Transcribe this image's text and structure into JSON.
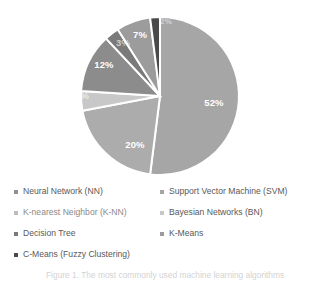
{
  "figure": {
    "background_color": "#ffffff",
    "caption_partial": "Figure 1. The most commonly used machine learning algorithms"
  },
  "chart_data": {
    "type": "pie",
    "title": "",
    "subtitle": "",
    "xlabel": "",
    "ylabel": "",
    "grid": false,
    "legend_position": "bottom",
    "legend_columns": 2,
    "start_angle_deg": 0,
    "direction": "clockwise",
    "categories": [
      "Support Vector Machine (SVM)",
      "Neural Network (NN)",
      "Bayesian Networks (BN)",
      "K-nearest Neighbor (K-NN)",
      "Decision Tree",
      "K-Means",
      "C-Means (Fuzzy Clustering)"
    ],
    "values": [
      52,
      20,
      4,
      12,
      3,
      7,
      2
    ],
    "labels": [
      "52%",
      "20%",
      "4%",
      "12%",
      "3%",
      "7%",
      "2%"
    ],
    "colors": [
      "#a6a6a6",
      "#acacac",
      "#c8c8c8",
      "#8c8c8c",
      "#7a7a7a",
      "#9c9c9c",
      "#4a4a4a"
    ],
    "slice_border_color": "#ffffff",
    "slice_border_width": 2,
    "units": "percent"
  },
  "pie": {
    "center_x": 160,
    "center_y": 96,
    "radius": 79,
    "slices": [
      {
        "name": "svm",
        "label": "52%",
        "value": 52,
        "color": "#a6a6a6",
        "label_x": 214,
        "label_y": 103,
        "label_style": "normal"
      },
      {
        "name": "nn",
        "label": "20%",
        "value": 20,
        "color": "#acacac",
        "label_x": 135,
        "label_y": 145,
        "label_style": "normal"
      },
      {
        "name": "bn",
        "label": "4%",
        "value": 4,
        "color": "#c8c8c8",
        "label_x": 82,
        "label_y": 96,
        "label_style": "faint"
      },
      {
        "name": "knn",
        "label": "12%",
        "value": 12,
        "color": "#8c8c8c",
        "label_x": 104,
        "label_y": 65,
        "label_style": "normal"
      },
      {
        "name": "dtree",
        "label": "3%",
        "value": 3,
        "color": "#7a7a7a",
        "label_x": 123,
        "label_y": 43,
        "label_style": "faint"
      },
      {
        "name": "kmeans",
        "label": "7%",
        "value": 7,
        "color": "#9c9c9c",
        "label_x": 140,
        "label_y": 35,
        "label_style": "normal"
      },
      {
        "name": "cmeans",
        "label": "2%",
        "value": 2,
        "color": "#4a4a4a",
        "label_x": 166,
        "label_y": 22,
        "label_style": "tiny"
      }
    ]
  },
  "legend": {
    "left_column": [
      {
        "label": "Neural Network (NN)",
        "marker_color": "#8f8f8f",
        "soft": false
      },
      {
        "label": "K-nearest Neighbor (K-NN)",
        "marker_color": "#bdbdbd",
        "soft": true
      },
      {
        "label": "Decision Tree",
        "marker_color": "#7a7a7a",
        "soft": false
      },
      {
        "label": "C-Means (Fuzzy Clustering)",
        "marker_color": "#4a4a4a",
        "soft": false
      }
    ],
    "right_column": [
      {
        "label": "Support Vector Machine (SVM)",
        "marker_color": "#a6a6a6",
        "soft": false
      },
      {
        "label": "Bayesian Networks (BN)",
        "marker_color": "#c8c8c8",
        "soft": false
      },
      {
        "label": "K-Means",
        "marker_color": "#9c9c9c",
        "soft": false
      }
    ]
  }
}
